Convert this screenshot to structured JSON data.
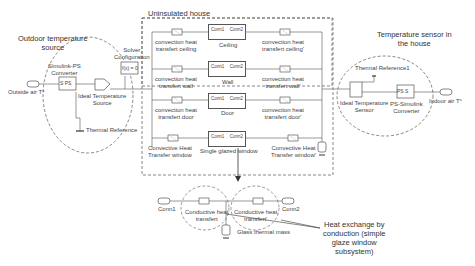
{
  "annotations": {
    "outdoor_source": "Outdoor temperature\nsource",
    "outdoor_source_line1": "Outdoor temperature",
    "outdoor_source_line2": "source",
    "house": "Uninsulated house",
    "sensor_line1": "Temperature sensor in",
    "sensor_line2": "the house",
    "heat_exchange_line1": "Heat exchange by",
    "heat_exchange_line2": "conduction (simple",
    "heat_exchange_line3": "glaze window",
    "heat_exchange_line4": "subsystem)"
  },
  "blocks": {
    "outside_air": "Outside air T°",
    "simulink_ps_line1": "Simulink-PS",
    "simulink_ps_line2": "Converter",
    "simulink_ps_glyph": "S PS",
    "ideal_temp_source_line1": "Ideal Temperature",
    "ideal_temp_source_line2": "Source",
    "thermal_reference": "Thermal Reference",
    "solver_line1": "Solver",
    "solver_line2": "Configuration",
    "solver_glyph": "f(x) = 0",
    "ideal_temp_sensor_line1": "Ideal Temperature",
    "ideal_temp_sensor_line2": "Sensor",
    "thermal_reference1": "Thermal Reference1",
    "ps_simulink_line1": "PS-Simulink",
    "ps_simulink_line2": "Converter",
    "ps_simulink_glyph": "PS S",
    "indoor_air": "Indoor air T°"
  },
  "house_rows": [
    {
      "left_line1": "convection heat",
      "left_line2": "transfert ceiling",
      "center": "Ceiling",
      "right_line1": "convection heat",
      "right_line2": "transfert ceiling'"
    },
    {
      "left_line1": "convection heat",
      "left_line2": "transfert wall",
      "center": "Wall",
      "right_line1": "convection heat",
      "right_line2": "transfert wall'"
    },
    {
      "left_line1": "convection heat",
      "left_line2": "transfert door",
      "center": "Door",
      "right_line1": "convection heat",
      "right_line2": "transfert door'"
    },
    {
      "left_line1": "Convective Heat",
      "left_line2": "Transfer window",
      "center": "Single glazed window",
      "right_line1": "Convective Heat",
      "right_line2": "Transfer window'"
    }
  ],
  "ports": {
    "conn1": "Conn1",
    "conn2": "Conn2"
  },
  "subsystem": {
    "conn1": "Conn1",
    "conn2": "Conn2",
    "left_line1": "Conductive heat",
    "left_line2": "transfert",
    "right_line1": "Conductive heat",
    "right_line2": "transfert'",
    "mass": "Glass thermal mass"
  }
}
